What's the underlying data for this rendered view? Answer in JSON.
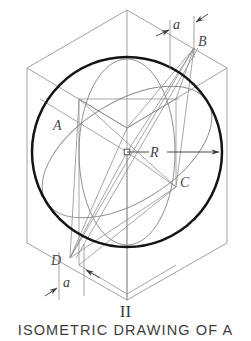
{
  "figure": {
    "number": "II",
    "caption": "ISOMETRIC DRAWING OF A",
    "title_alt": "Isometric drawing of a sphere in a cube"
  },
  "colors": {
    "background": "#ffffff",
    "heavy_line": "#141414",
    "construction_line": "#8a8a8a",
    "cube_line": "#909090",
    "dimension_line": "#5a5a5a",
    "label_text": "#4a4a4a",
    "caption_text": "#3d3d3d"
  },
  "labels": {
    "point_a": "A",
    "point_b": "B",
    "point_c": "C",
    "point_d": "D",
    "radius": "R",
    "dimension_top": "a",
    "dimension_bottom": "a"
  },
  "geometry": {
    "circle": {
      "center_x": 127,
      "center_y": 152,
      "radius": 95,
      "stroke_width": 2.4,
      "role": "sphere-outline"
    },
    "cube_isometric": {
      "note": "isometric cube enclosing the sphere, hexagonal silhouette",
      "vertices": {
        "top_rear": [
          127,
          10
        ],
        "top_left": [
          27,
          68
        ],
        "top_right": [
          227,
          68
        ],
        "center_front": [
          127,
          128
        ],
        "bottom_left": [
          27,
          243
        ],
        "bottom_right": [
          227,
          243
        ],
        "bottom_front": [
          127,
          300
        ]
      }
    },
    "ellipse_front": {
      "cx": 127,
      "cy": 152,
      "rx": 48,
      "ry": 93,
      "rotation_deg": 0,
      "role": "great-circle-vertical"
    },
    "ellipse_oblique": {
      "cx": 127,
      "cy": 152,
      "rx": 95,
      "ry": 50,
      "rotation_deg": 30,
      "role": "great-circle-oblique"
    },
    "radius_dimension": {
      "from": [
        127,
        152
      ],
      "to": [
        222,
        152
      ],
      "label": "R"
    },
    "dimension_a_top": {
      "extension_x1": 170,
      "extension_x2": 194,
      "line_y": 30,
      "label": "a"
    },
    "dimension_a_bottom": {
      "extension_x1": 59,
      "extension_x2": 84,
      "line_y": 283,
      "label": "a"
    }
  }
}
